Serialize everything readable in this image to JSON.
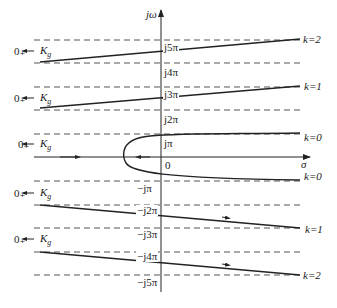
{
  "diagram": {
    "type": "root-locus-diagram",
    "axes": {
      "vertical_label": "jω",
      "horizontal_label": "σ",
      "origin_label": "0"
    },
    "imag_ticks": [
      {
        "label": "j5π",
        "y": 40
      },
      {
        "label": "j4π",
        "y": 63
      },
      {
        "label": "j3π",
        "y": 87
      },
      {
        "label": "j2π",
        "y": 110
      },
      {
        "label": "jπ",
        "y": 134
      },
      {
        "label": "−jπ",
        "y": 181
      },
      {
        "label": "−j2π",
        "y": 205
      },
      {
        "label": "−j3π",
        "y": 228
      },
      {
        "label": "−j4π",
        "y": 252
      },
      {
        "label": "−j5π",
        "y": 275
      }
    ],
    "branches": [
      {
        "k_label": "k=2",
        "start_label": "0₊",
        "gain_label": "K",
        "gain_sub": "g"
      },
      {
        "k_label": "k=1",
        "start_label": "0₊",
        "gain_label": "K",
        "gain_sub": "g"
      },
      {
        "k_label": "k=0",
        "start_label": "0₊",
        "gain_label": "K",
        "gain_sub": "g"
      },
      {
        "k_label": "k=0"
      },
      {
        "k_label": "k=1",
        "start_label": "0₊",
        "gain_label": "K",
        "gain_sub": "g"
      },
      {
        "k_label": "k=2",
        "start_label": "0₊",
        "gain_label": "K",
        "gain_sub": "g"
      }
    ],
    "colors": {
      "line": "#222222",
      "dashed": "#555555",
      "background": "#ffffff"
    }
  }
}
